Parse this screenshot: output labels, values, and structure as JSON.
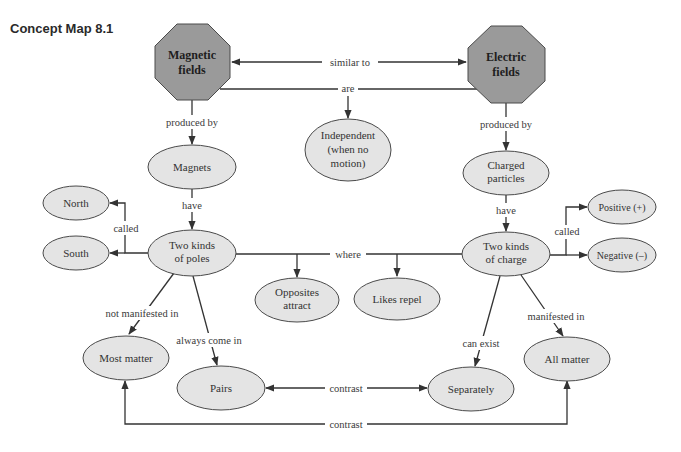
{
  "title": "Concept Map 8.1",
  "colors": {
    "octagon_fill": "#9a9a9a",
    "ellipse_fill": "#e4e4e4",
    "stroke": "#333333"
  },
  "nodes": {
    "magnetic_fields": {
      "lines": [
        "Magnetic",
        "fields"
      ],
      "shape": "octagon"
    },
    "electric_fields": {
      "lines": [
        "Electric",
        "fields"
      ],
      "shape": "octagon"
    },
    "independent": {
      "lines": [
        "Independent",
        "(when no",
        "motion)"
      ],
      "shape": "ellipse"
    },
    "magnets": {
      "lines": [
        "Magnets"
      ],
      "shape": "ellipse"
    },
    "charged_particles": {
      "lines": [
        "Charged",
        "particles"
      ],
      "shape": "ellipse"
    },
    "two_kinds_poles": {
      "lines": [
        "Two kinds",
        "of poles"
      ],
      "shape": "ellipse"
    },
    "two_kinds_charge": {
      "lines": [
        "Two kinds",
        "of charge"
      ],
      "shape": "ellipse"
    },
    "north": {
      "lines": [
        "North"
      ],
      "shape": "ellipse"
    },
    "south": {
      "lines": [
        "South"
      ],
      "shape": "ellipse"
    },
    "positive": {
      "lines": [
        "Positive (+)"
      ],
      "shape": "ellipse"
    },
    "negative": {
      "lines": [
        "Negative (–)"
      ],
      "shape": "ellipse"
    },
    "opposites_attract": {
      "lines": [
        "Opposites",
        "attract"
      ],
      "shape": "ellipse"
    },
    "likes_repel": {
      "lines": [
        "Likes repel"
      ],
      "shape": "ellipse"
    },
    "most_matter": {
      "lines": [
        "Most matter"
      ],
      "shape": "ellipse"
    },
    "pairs": {
      "lines": [
        "Pairs"
      ],
      "shape": "ellipse"
    },
    "separately": {
      "lines": [
        "Separately"
      ],
      "shape": "ellipse"
    },
    "all_matter": {
      "lines": [
        "All matter"
      ],
      "shape": "ellipse"
    }
  },
  "links": {
    "similar_to": "similar to",
    "are": "are",
    "produced_by_left": "produced by",
    "produced_by_right": "produced by",
    "have_left": "have",
    "have_right": "have",
    "called_left": "called",
    "called_right": "called",
    "where": "where",
    "not_manifested_in": "not manifested in",
    "always_come_in": "always come in",
    "can_exist": "can exist",
    "manifested_in": "manifested in",
    "contrast_pairs_separately": "contrast",
    "contrast_most_all": "contrast"
  }
}
